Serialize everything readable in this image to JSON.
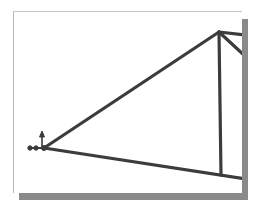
{
  "diagram": {
    "type": "truss",
    "colors": {
      "member": "#3c3c3c",
      "frame_shadow": "#8a8a8a",
      "frame_border": "#b8b8b8",
      "background": "#ffffff"
    },
    "joints": [
      {
        "id": "A",
        "x": 44,
        "y": 148,
        "note": "pin support with axis arrows"
      },
      {
        "id": "B",
        "x": 219,
        "y": 32
      },
      {
        "id": "C",
        "x": 221,
        "y": 175
      }
    ],
    "members": [
      {
        "from": "A",
        "to": "B"
      },
      {
        "from": "A",
        "to": "C-extended"
      },
      {
        "from": "B",
        "to": "C"
      },
      {
        "from": "B",
        "to": "right-top"
      },
      {
        "from": "B",
        "to": "right-diag"
      }
    ]
  }
}
